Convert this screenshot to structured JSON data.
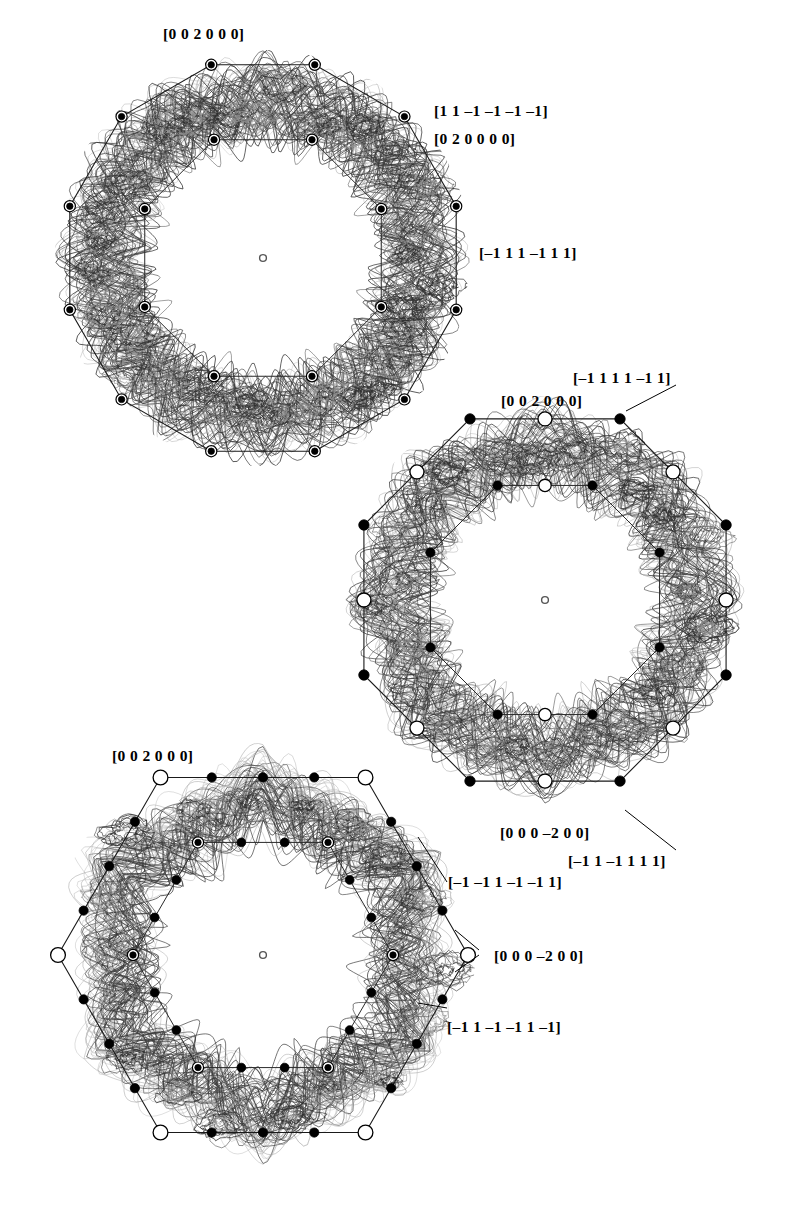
{
  "figure": {
    "kind": "fermi-surface-brillouin-zone-projections",
    "background_color": "#ffffff",
    "line_color": "#1a1a1a",
    "band_color_dark": "#3a3a3a",
    "band_color_light": "#9a9a9a",
    "panel_count": 3
  },
  "panels": [
    {
      "id": "top",
      "shape": "dodecagon",
      "center": [
        263,
        258
      ],
      "outer_radius": 200,
      "inner_radius": 128,
      "center_marker": "open-circle",
      "vertex_marker": "ringed-filled-circle",
      "inner_marker": "ringed-filled-circle",
      "labels": [
        {
          "name": "label-top-002000",
          "text": "[0 0 2 0 0 0]",
          "x": 163,
          "y": 26,
          "leader": false
        },
        {
          "name": "label-top-11m1m1m1m1",
          "text": "[1 1 –1 –1 –1 –1]",
          "x": 434,
          "y": 103,
          "leader": false
        },
        {
          "name": "label-top-020000",
          "text": "[0 2 0 0 0 0]",
          "x": 434,
          "y": 131,
          "leader": false
        },
        {
          "name": "label-top-m111m111",
          "text": "[–1 1 1 –1 1 1]",
          "x": 479,
          "y": 245,
          "leader": false
        }
      ]
    },
    {
      "id": "middle",
      "shape": "octagon",
      "center": [
        545,
        600
      ],
      "outer_radius": 196,
      "inner_radius": 124,
      "center_marker": "open-circle",
      "labels": [
        {
          "name": "label-mid-m1111m11",
          "text": "[–1 1 1 1 –1 1]",
          "x": 573,
          "y": 370,
          "leader": true
        },
        {
          "name": "label-mid-002000",
          "text": "[0 0 2 0 0 0]",
          "x": 501,
          "y": 393,
          "leader": false
        },
        {
          "name": "label-mid-000m200",
          "text": "[0 0 0 –2 0 0]",
          "x": 500,
          "y": 825,
          "leader": false
        },
        {
          "name": "label-mid-m11m1111",
          "text": "[–1 1 –1 1 1 1]",
          "x": 568,
          "y": 853,
          "leader": true
        }
      ]
    },
    {
      "id": "bottom",
      "shape": "hexagon",
      "center": [
        263,
        955
      ],
      "outer_radius": 205,
      "inner_radius": 130,
      "center_marker": "open-circle",
      "labels": [
        {
          "name": "label-bot-002000",
          "text": "[0 0 2 0 0 0]",
          "x": 112,
          "y": 748,
          "leader": false
        },
        {
          "name": "label-bot-m1m11m1m11",
          "text": "[–1 –1 1 –1 –1 1]",
          "x": 448,
          "y": 874,
          "leader": true
        },
        {
          "name": "label-bot-000m200",
          "text": "[0 0 0 –2 0 0]",
          "x": 494,
          "y": 948,
          "leader": true
        },
        {
          "name": "label-bot-m11m1m11m1",
          "text": "[–1 1 –1 –1 1 –1]",
          "x": 447,
          "y": 1019,
          "leader": true
        }
      ]
    }
  ],
  "all_miller_indices": [
    "[0 0 2 0 0 0]",
    "[1 1 –1 –1 –1 –1]",
    "[0 2 0 0 0 0]",
    "[–1 1 1 –1 1 1]",
    "[–1 1 1 1 –1 1]",
    "[0 0 0 –2 0 0]",
    "[–1 1 –1 1 1 1]",
    "[–1 –1 1 –1 –1 1]",
    "[–1 1 –1 –1 1 –1]"
  ]
}
